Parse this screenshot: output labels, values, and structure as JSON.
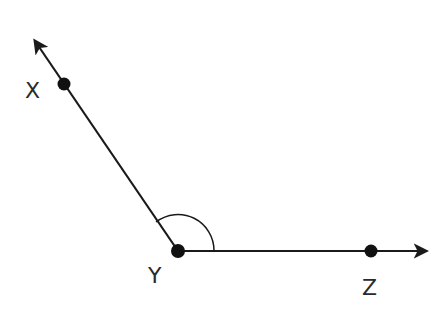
{
  "diagram": {
    "type": "angle",
    "points": {
      "X": {
        "label": "X",
        "x": 64,
        "y": 84
      },
      "Y": {
        "label": "Y",
        "x": 178,
        "y": 251
      },
      "Z": {
        "label": "Z",
        "x": 371,
        "y": 251
      }
    },
    "rays": [
      {
        "name": "ray-YX",
        "from": "Y",
        "through": "X",
        "arrow_tip": {
          "x": 33,
          "y": 38
        }
      },
      {
        "name": "ray-YZ",
        "from": "Y",
        "through": "Z",
        "arrow_tip": {
          "x": 429,
          "y": 251
        }
      }
    ],
    "angle_mark": {
      "vertex": "Y",
      "radius": 36
    },
    "colors": {
      "stroke": "#1a1a1a",
      "label": "#2a2a2a",
      "background": "#ffffff"
    }
  }
}
